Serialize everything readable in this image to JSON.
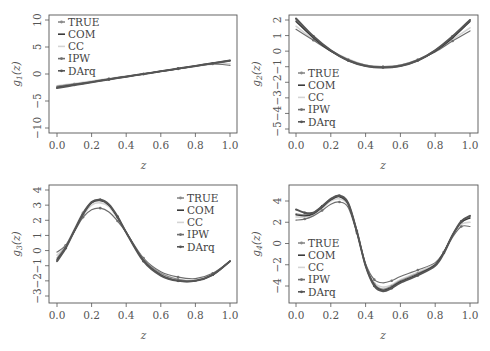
{
  "chart_data": [
    {
      "type": "line",
      "title": "",
      "xlabel": "z",
      "ylabel": "g1(z)",
      "ylabel_sub": "1",
      "xlim": [
        0,
        1
      ],
      "ylim": [
        -10,
        10
      ],
      "xticks": [
        "0.0",
        "0.2",
        "0.4",
        "0.6",
        "0.8",
        "1.0"
      ],
      "yticks": [
        "-10",
        "-5",
        "0",
        "5",
        "10"
      ],
      "legend_position": "top-left",
      "x": [
        0.0,
        0.1,
        0.2,
        0.3,
        0.4,
        0.5,
        0.6,
        0.7,
        0.8,
        0.9,
        1.0
      ],
      "series": [
        {
          "name": "TRUE",
          "values": [
            -2.4,
            -1.9,
            -1.45,
            -0.95,
            -0.5,
            0.0,
            0.5,
            0.95,
            1.45,
            1.9,
            2.4
          ]
        },
        {
          "name": "COM",
          "values": [
            -2.5,
            -2.0,
            -1.5,
            -1.0,
            -0.5,
            0.0,
            0.5,
            1.0,
            1.5,
            2.0,
            2.5
          ]
        },
        {
          "name": "CC",
          "values": [
            -2.2,
            -1.75,
            -1.3,
            -0.85,
            -0.4,
            0.05,
            0.5,
            0.95,
            1.4,
            1.8,
            1.9
          ]
        },
        {
          "name": "IPW",
          "values": [
            -2.3,
            -1.85,
            -1.4,
            -0.9,
            -0.45,
            0.0,
            0.5,
            0.95,
            1.45,
            1.85,
            1.6
          ]
        },
        {
          "name": "DArq",
          "values": [
            -2.6,
            -2.05,
            -1.55,
            -1.0,
            -0.5,
            0.0,
            0.5,
            1.0,
            1.5,
            2.0,
            2.5
          ]
        }
      ]
    },
    {
      "type": "line",
      "title": "",
      "xlabel": "z",
      "ylabel": "g2(z)",
      "ylabel_sub": "2",
      "xlim": [
        0,
        1
      ],
      "ylim": [
        -5,
        2
      ],
      "xticks": [
        "0.0",
        "0.2",
        "0.4",
        "0.6",
        "0.8",
        "1.0"
      ],
      "yticks": [
        "-5",
        "-4",
        "-3",
        "-2",
        "-1",
        "0",
        "1",
        "2"
      ],
      "legend_position": "bottom-left",
      "x": [
        0.0,
        0.1,
        0.2,
        0.3,
        0.4,
        0.5,
        0.6,
        0.7,
        0.8,
        0.9,
        1.0
      ],
      "series": [
        {
          "name": "TRUE",
          "values": [
            2.0,
            0.9,
            0.05,
            -0.55,
            -0.9,
            -1.0,
            -0.9,
            -0.55,
            0.05,
            0.9,
            2.0
          ]
        },
        {
          "name": "COM",
          "values": [
            1.9,
            0.85,
            0.0,
            -0.6,
            -0.95,
            -1.05,
            -0.95,
            -0.6,
            0.0,
            0.85,
            1.9
          ]
        },
        {
          "name": "CC",
          "values": [
            1.6,
            0.75,
            0.05,
            -0.5,
            -0.9,
            -1.0,
            -0.9,
            -0.55,
            0.0,
            0.75,
            1.5
          ]
        },
        {
          "name": "IPW",
          "values": [
            1.4,
            0.7,
            0.0,
            -0.55,
            -0.9,
            -1.0,
            -0.9,
            -0.55,
            -0.05,
            0.65,
            1.3
          ]
        },
        {
          "name": "DArq",
          "values": [
            2.1,
            0.95,
            0.05,
            -0.6,
            -0.95,
            -1.05,
            -0.95,
            -0.6,
            0.05,
            0.95,
            2.0
          ]
        }
      ]
    },
    {
      "type": "line",
      "title": "",
      "xlabel": "z",
      "ylabel": "g3(z)",
      "ylabel_sub": "3",
      "xlim": [
        0,
        1
      ],
      "ylim": [
        -3,
        4
      ],
      "xticks": [
        "0.0",
        "0.2",
        "0.4",
        "0.6",
        "0.8",
        "1.0"
      ],
      "yticks": [
        "-3",
        "-2",
        "-1",
        "0",
        "1",
        "2",
        "3",
        "4"
      ],
      "legend_position": "top-right",
      "x": [
        0.0,
        0.05,
        0.1,
        0.15,
        0.2,
        0.25,
        0.3,
        0.35,
        0.4,
        0.5,
        0.6,
        0.7,
        0.8,
        0.9,
        1.0
      ],
      "series": [
        {
          "name": "TRUE",
          "values": [
            -0.5,
            0.3,
            1.4,
            2.5,
            3.2,
            3.35,
            3.0,
            2.2,
            1.2,
            -0.6,
            -1.5,
            -1.9,
            -2.0,
            -1.6,
            -0.7
          ]
        },
        {
          "name": "COM",
          "values": [
            -0.6,
            0.2,
            1.3,
            2.4,
            3.15,
            3.3,
            3.0,
            2.2,
            1.2,
            -0.65,
            -1.6,
            -2.0,
            -2.0,
            -1.6,
            -0.7
          ]
        },
        {
          "name": "CC",
          "values": [
            -0.3,
            0.3,
            1.3,
            2.3,
            3.0,
            3.15,
            2.9,
            2.1,
            1.2,
            -0.6,
            -1.5,
            -1.9,
            -1.95,
            -1.55,
            -0.7
          ]
        },
        {
          "name": "IPW",
          "values": [
            -0.1,
            0.35,
            1.25,
            2.2,
            2.7,
            2.8,
            2.55,
            1.95,
            1.2,
            -0.5,
            -1.4,
            -1.75,
            -1.85,
            -1.5,
            -0.7
          ]
        },
        {
          "name": "DArq",
          "values": [
            -0.7,
            0.15,
            1.3,
            2.4,
            3.2,
            3.35,
            3.05,
            2.25,
            1.2,
            -0.7,
            -1.65,
            -2.0,
            -2.0,
            -1.6,
            -0.7
          ]
        }
      ]
    },
    {
      "type": "line",
      "title": "",
      "xlabel": "z",
      "ylabel": "g4(z)",
      "ylabel_sub": "4",
      "xlim": [
        0,
        1
      ],
      "ylim": [
        -5,
        5
      ],
      "xticks": [
        "0.0",
        "0.2",
        "0.4",
        "0.6",
        "0.8",
        "1.0"
      ],
      "yticks": [
        "-4",
        "-2",
        "0",
        "2",
        "4"
      ],
      "legend_position": "bottom-left",
      "x": [
        0.0,
        0.05,
        0.1,
        0.15,
        0.2,
        0.25,
        0.3,
        0.35,
        0.4,
        0.45,
        0.5,
        0.55,
        0.6,
        0.7,
        0.8,
        0.85,
        0.9,
        0.95,
        1.0
      ],
      "series": [
        {
          "name": "TRUE",
          "values": [
            2.8,
            2.7,
            2.9,
            3.5,
            4.2,
            4.5,
            3.8,
            1.2,
            -2.0,
            -3.8,
            -4.3,
            -4.0,
            -3.5,
            -2.8,
            -2.0,
            -0.8,
            0.8,
            2.0,
            2.5
          ]
        },
        {
          "name": "COM",
          "values": [
            2.7,
            2.6,
            2.8,
            3.4,
            4.1,
            4.4,
            3.7,
            1.1,
            -2.1,
            -3.9,
            -4.4,
            -4.1,
            -3.6,
            -2.9,
            -2.0,
            -0.8,
            0.8,
            2.0,
            2.4
          ]
        },
        {
          "name": "CC",
          "values": [
            2.5,
            2.5,
            2.7,
            3.3,
            4.0,
            4.2,
            3.6,
            1.1,
            -2.0,
            -3.7,
            -4.1,
            -3.9,
            -3.4,
            -2.7,
            -1.9,
            -0.8,
            0.7,
            1.8,
            2.0
          ]
        },
        {
          "name": "IPW",
          "values": [
            2.2,
            2.3,
            2.6,
            3.1,
            3.7,
            3.9,
            3.4,
            1.0,
            -1.9,
            -3.4,
            -3.7,
            -3.5,
            -3.1,
            -2.5,
            -1.8,
            -0.8,
            0.6,
            1.6,
            1.6
          ]
        },
        {
          "name": "DArq",
          "values": [
            3.2,
            2.9,
            2.9,
            3.5,
            4.2,
            4.5,
            3.8,
            1.1,
            -2.1,
            -4.0,
            -4.5,
            -4.2,
            -3.7,
            -3.0,
            -2.1,
            -0.9,
            0.8,
            2.1,
            2.6
          ]
        }
      ]
    }
  ],
  "legend": {
    "entries": [
      "TRUE",
      "COM",
      "CC",
      "IPW",
      "DArq"
    ],
    "colors": {
      "TRUE": "#8a8a8a",
      "COM": "#3a3a3a",
      "CC": "#d4d4d4",
      "IPW": "#6e6e6e",
      "DArq": "#555555"
    }
  }
}
